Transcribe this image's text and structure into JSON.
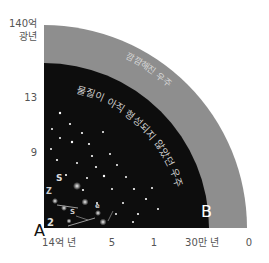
{
  "diagram": {
    "type": "quarter-circle-universe",
    "origin": {
      "x": 44,
      "y": 228
    },
    "outer_radius": 203,
    "inner_radius": 165,
    "colors": {
      "outer_band": "#8e8e8e",
      "inner_region": "#0d0d0d",
      "star": "#ffffff",
      "band_text": "#d8d8d8",
      "inner_text": "#d0d0d0",
      "axis_text": "#555555"
    },
    "regions": {
      "outer_band_label": "깜깜해진 우주",
      "inner_region_label": "물질이 아직 형성되지 않았던 우주"
    },
    "points": {
      "a": "A",
      "b": "B"
    },
    "y_axis": {
      "top_label_line1": "140억",
      "top_label_line2": "광년",
      "ticks": [
        "13",
        "9"
      ]
    },
    "x_axis": {
      "ticks": [
        "14억 년",
        "5",
        "1",
        "30만 년",
        "0"
      ]
    }
  }
}
